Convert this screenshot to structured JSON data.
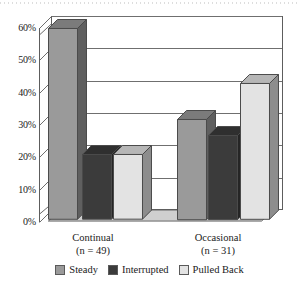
{
  "chart_data": {
    "type": "bar",
    "title": "",
    "subtitle": "",
    "xlabel": "",
    "ylabel": "",
    "categories": [
      "Continual\n(n = 49)",
      "Occasional\n(n = 31)"
    ],
    "group_labels": [
      {
        "name": "Continual",
        "n_text": "(n = 49)",
        "n": 49
      },
      {
        "name": "Occasional",
        "n_text": "(n = 31)",
        "n": 31
      }
    ],
    "series": [
      {
        "name": "Steady",
        "color": "#9a9a9a",
        "values": [
          59,
          31
        ]
      },
      {
        "name": "Interrupted",
        "color": "#3b3b3b",
        "values": [
          20,
          26
        ]
      },
      {
        "name": "Pulled Back",
        "color": "#e3e3e3",
        "values": [
          20,
          42
        ]
      }
    ],
    "ylim": [
      0,
      60
    ],
    "ytick_step": 10,
    "ytick_labels": [
      "60%",
      "50%",
      "40%",
      "30%",
      "20%",
      "10%",
      "0%"
    ],
    "ytick_values": [
      60,
      50,
      40,
      30,
      20,
      10,
      0
    ],
    "value_format": "percent",
    "grid": true,
    "grid_axis": "y",
    "legend_position": "bottom",
    "three_d": true
  },
  "legend": {
    "items": [
      {
        "label": "Steady",
        "color": "#9a9a9a"
      },
      {
        "label": "Interrupted",
        "color": "#3b3b3b"
      },
      {
        "label": "Pulled Back",
        "color": "#e3e3e3"
      }
    ]
  },
  "axis": {
    "y_labels": [
      "60%",
      "50%",
      "40%",
      "30%",
      "20%",
      "10%",
      "0%"
    ]
  },
  "colors": {
    "steady": "#9a9a9a",
    "interrupted": "#3b3b3b",
    "pulled_back": "#e3e3e3",
    "axis": "#5d5d5d",
    "grid": "#6f6f6f",
    "background": "#ffffff",
    "text": "#1a1a1a"
  }
}
